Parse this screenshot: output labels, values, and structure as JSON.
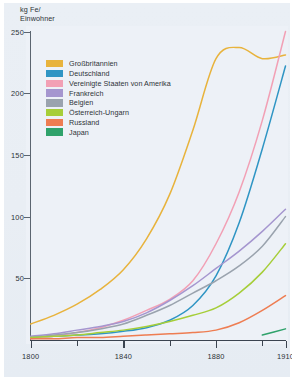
{
  "chart_data": {
    "type": "line",
    "title": "",
    "ylabel": "kg Fe/\nEinwohner",
    "xlabel": "",
    "xlim": [
      1800,
      1910
    ],
    "ylim": [
      0,
      250
    ],
    "grid": false,
    "legend_position": "upper-left-inside",
    "y_ticks": [
      250,
      200,
      150,
      100,
      50
    ],
    "x_ticks": [
      1800,
      1840,
      1880,
      1910
    ],
    "x_minor_ticks": [
      1820,
      1860,
      1900
    ],
    "x": [
      1800,
      1810,
      1820,
      1830,
      1840,
      1850,
      1860,
      1870,
      1880,
      1890,
      1900,
      1910
    ],
    "series": [
      {
        "name": "Großbritannien",
        "color": "#e8b33c",
        "values": [
          13,
          20,
          29,
          41,
          57,
          82,
          118,
          170,
          228,
          237,
          228,
          231
        ]
      },
      {
        "name": "Deutschland",
        "color": "#2f95c4",
        "values": [
          2,
          3,
          4,
          5,
          7,
          10,
          16,
          28,
          52,
          95,
          155,
          222
        ]
      },
      {
        "name": "Vereinigte Staaten von Amerika",
        "color": "#f2a0b5",
        "values": [
          1,
          3,
          6,
          10,
          16,
          24,
          33,
          48,
          78,
          120,
          178,
          250
        ]
      },
      {
        "name": "Frankreich",
        "color": "#a596cf",
        "values": [
          3,
          5,
          8,
          11,
          15,
          22,
          32,
          44,
          58,
          72,
          88,
          106
        ]
      },
      {
        "name": "Belgien",
        "color": "#9aa3ae",
        "values": [
          2,
          4,
          6,
          9,
          13,
          20,
          28,
          38,
          48,
          60,
          76,
          100
        ]
      },
      {
        "name": "Österreich-Ungarn",
        "color": "#a6ce39",
        "values": [
          2,
          3,
          4,
          6,
          8,
          11,
          15,
          20,
          26,
          38,
          55,
          78
        ]
      },
      {
        "name": "Russland",
        "color": "#ee7d52",
        "values": [
          1,
          1,
          2,
          2,
          3,
          4,
          5,
          6,
          8,
          14,
          24,
          36
        ]
      },
      {
        "name": "Japan",
        "color": "#2fa26b",
        "values": [
          null,
          null,
          null,
          null,
          null,
          null,
          null,
          null,
          null,
          null,
          4,
          9
        ]
      }
    ]
  },
  "axis": {
    "y_title": "kg Fe/\nEinwohner",
    "y_labels": [
      "250",
      "200",
      "150",
      "100",
      "50"
    ],
    "x_labels": [
      "1800",
      "1840",
      "1880",
      "1910"
    ]
  },
  "legend": {
    "items": [
      {
        "label": "Großbritannien",
        "color": "#e8b33c"
      },
      {
        "label": "Deutschland",
        "color": "#2f95c4"
      },
      {
        "label": "Vereinigte Staaten von Amerika",
        "color": "#f2a0b5"
      },
      {
        "label": "Frankreich",
        "color": "#a596cf"
      },
      {
        "label": "Belgien",
        "color": "#9aa3ae"
      },
      {
        "label": "Österreich-Ungarn",
        "color": "#a6ce39"
      },
      {
        "label": "Russland",
        "color": "#ee7d52"
      },
      {
        "label": "Japan",
        "color": "#2fa26b"
      }
    ]
  }
}
